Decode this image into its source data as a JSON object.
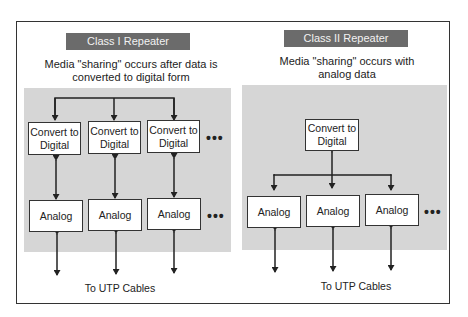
{
  "diagram": {
    "class1": {
      "title": "Class I Repeater",
      "subtitle_line1": "Media \"sharing\" occurs after data is",
      "subtitle_line2": "converted to digital form",
      "convert_boxes": [
        {
          "line1": "Convert to",
          "line2": "Digital"
        },
        {
          "line1": "Convert to",
          "line2": "Digital"
        },
        {
          "line1": "Convert to",
          "line2": "Digital"
        }
      ],
      "analog_boxes": [
        "Analog",
        "Analog",
        "Analog"
      ],
      "ellipsis": "•••",
      "caption": "To UTP Cables"
    },
    "class2": {
      "title": "Class II Repeater",
      "subtitle_line1": "Media \"sharing\" occurs with",
      "subtitle_line2": "analog data",
      "convert_box": {
        "line1": "Convert to",
        "line2": "Digital"
      },
      "analog_boxes": [
        "Analog",
        "Analog",
        "Analog"
      ],
      "ellipsis": "•••",
      "caption": "To UTP Cables"
    },
    "colors": {
      "title_bar": "#6b6b6b",
      "panel": "#d6d6d6",
      "line": "#222222"
    }
  }
}
